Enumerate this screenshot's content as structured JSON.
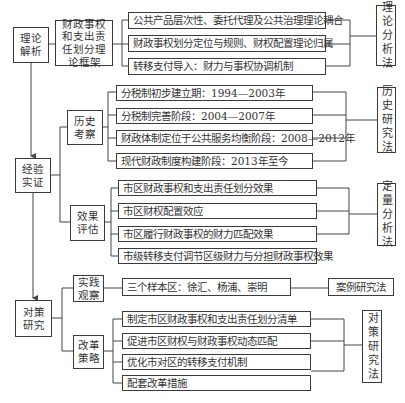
{
  "sections": [
    {
      "label": "理论解析",
      "framework": "财政事权和支出责任划分理论框架",
      "items": [
        "公共产品层次性、委托代理及公共治理理论耦合",
        "财政事权划分定位与规则、财权配置理论归属",
        "转移支付导入：财力与事权协调机制"
      ],
      "method": "理论分析法"
    },
    {
      "label": "经验实证",
      "subgroups": [
        {
          "label": "历史考察",
          "items": [
            "分税制初步建立期：1994—2003年",
            "分税制完善阶段：2004—2007年",
            "财政体制定位于公共服务均衡阶段：2008—2012年",
            "现代财政制度构建阶段：2013年至今"
          ],
          "method": "历史研究法"
        },
        {
          "label": "效果评估",
          "items": [
            "市区财政事权和支出责任划分效果",
            "市区财权配置效应",
            "市区履行财政事权的财力匹配效果",
            "市级转移支付调节区级财力与分担财政事权效果"
          ],
          "method": "定量分析法"
        }
      ]
    },
    {
      "label": "对策研究",
      "subgroups": [
        {
          "label": "实践观察",
          "items": [
            "三个样本区：徐汇、杨浦、崇明"
          ],
          "method": "案例研究法"
        },
        {
          "label": "改革策略",
          "items": [
            "制定市区财政事权和支出责任划分清单",
            "促进市区财权与财政事权动态匹配",
            "优化市对区的转移支付机制",
            "配套改革措施"
          ],
          "method": "对策研究法"
        }
      ]
    }
  ]
}
